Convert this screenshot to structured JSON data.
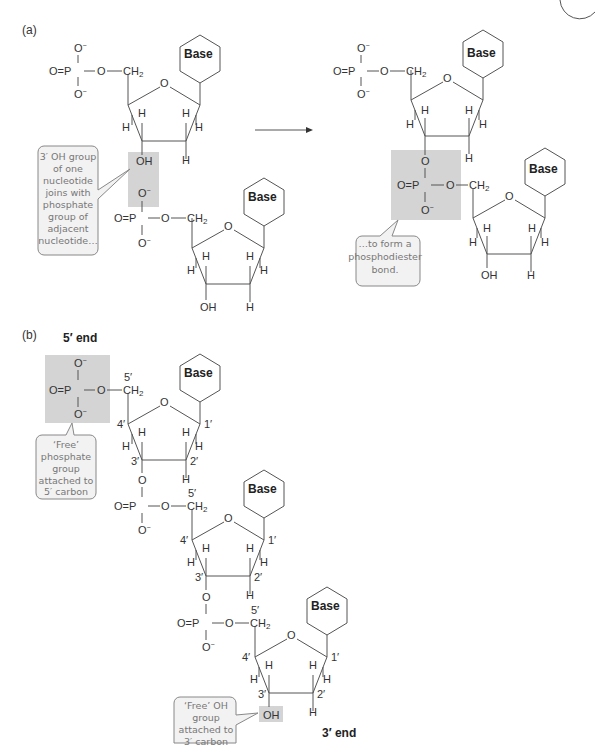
{
  "panel_a": {
    "label": "(a)",
    "base_label": "Base",
    "callout_left": [
      "3′ OH group",
      "of one",
      "nucleotide",
      "joins with",
      "phosphate",
      "group of",
      "adjacent",
      "nucleotide…"
    ],
    "callout_right": [
      "…to form a",
      "phosphodiester",
      "bond."
    ],
    "atoms": {
      "O": "O",
      "P": "P",
      "CH2": "CH",
      "CH2_sub": "2",
      "H": "H",
      "OH": "OH",
      "Ominus": "O",
      "minus": "−"
    }
  },
  "panel_b": {
    "label": "(b)",
    "five_end": "5′ end",
    "three_end": "3′ end",
    "base_label": "Base",
    "callout_phosphate": [
      "‘Free’",
      "phosphate",
      "group",
      "attached to",
      "5′ carbon"
    ],
    "callout_oh": [
      "‘Free’ OH",
      "group",
      "attached to",
      "3′ carbon"
    ],
    "carbon_numbers": {
      "c1": "1′",
      "c2": "2′",
      "c3": "3′",
      "c4": "4′",
      "c5": "5′"
    }
  },
  "colors": {
    "shade": "#d4d4d4",
    "callout_fill": "#f2f2f2",
    "line": "#555555",
    "callout_text": "#777777"
  }
}
